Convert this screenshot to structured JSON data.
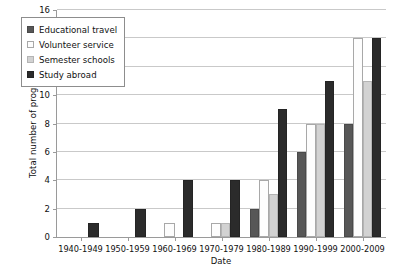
{
  "chart_data": {
    "type": "bar",
    "title": "",
    "xlabel": "Date",
    "ylabel": "Total number of programmes",
    "ylim": [
      0,
      16
    ],
    "yticks": [
      0,
      2,
      4,
      6,
      8,
      10,
      12,
      14,
      16
    ],
    "grid": true,
    "legend_position": "upper-left-inside",
    "categories": [
      "1940-1949",
      "1950-1959",
      "1960-1969",
      "1970-1979",
      "1980-1989",
      "1990-1999",
      "2000-2009"
    ],
    "series": [
      {
        "name": "Educational travel",
        "color": "#575757",
        "values": [
          0,
          0,
          0,
          0,
          2,
          6,
          8
        ]
      },
      {
        "name": "Volunteer service",
        "color": "#fdfdfd",
        "values": [
          0,
          0,
          1,
          1,
          4,
          8,
          14
        ]
      },
      {
        "name": "Semester schools",
        "color": "#d2d2d2",
        "values": [
          0,
          0,
          0,
          1,
          3,
          8,
          11
        ]
      },
      {
        "name": "Study abroad",
        "color": "#2b2b2b",
        "values": [
          1,
          2,
          4,
          4,
          9,
          11,
          14
        ]
      }
    ]
  }
}
